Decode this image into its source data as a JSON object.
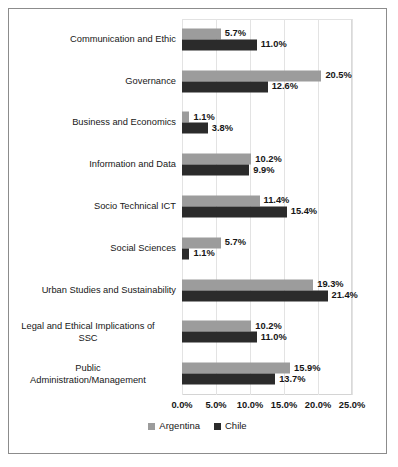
{
  "chart_data": {
    "type": "bar",
    "orientation": "horizontal",
    "title": "",
    "xlabel": "",
    "ylabel": "",
    "xlim": [
      0,
      25
    ],
    "grid": true,
    "legend_position": "bottom",
    "categories": [
      "Communication and Ethic",
      "Governance",
      "Business and Economics",
      "Information and Data",
      "Socio Technical ICT",
      "Social Sciences",
      "Urban Studies and Sustainability",
      "Legal and Ethical Implications of\nSSC",
      "Public\nAdministration/Management"
    ],
    "xticks": [
      "0.0%",
      "5.0%",
      "10.0%",
      "15.0%",
      "20.0%",
      "25.0%"
    ],
    "xtick_values": [
      0,
      5,
      10,
      15,
      20,
      25
    ],
    "series": [
      {
        "name": "Argentina",
        "color": "#9c9c9c",
        "values": [
          5.7,
          20.5,
          1.1,
          10.2,
          11.4,
          5.7,
          19.3,
          10.2,
          15.9
        ],
        "labels": [
          "5.7%",
          "20.5%",
          "1.1%",
          "10.2%",
          "11.4%",
          "5.7%",
          "19.3%",
          "10.2%",
          "15.9%"
        ]
      },
      {
        "name": "Chile",
        "color": "#2b2b2b",
        "values": [
          11.0,
          12.6,
          3.8,
          9.9,
          15.4,
          1.1,
          21.4,
          11.0,
          13.7
        ],
        "labels": [
          "11.0%",
          "12.6%",
          "3.8%",
          "9.9%",
          "15.4%",
          "1.1%",
          "21.4%",
          "11.0%",
          "13.7%"
        ]
      }
    ]
  },
  "legend": {
    "items": [
      {
        "label": "Argentina",
        "color": "#9c9c9c"
      },
      {
        "label": "Chile",
        "color": "#2b2b2b"
      }
    ]
  }
}
